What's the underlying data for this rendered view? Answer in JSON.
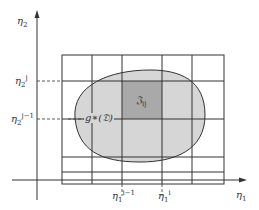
{
  "diagram": {
    "axes": {
      "x_label": "η",
      "x_label_sub": "1",
      "y_label": "η",
      "y_label_sub": "2"
    },
    "ticks": {
      "x_left": {
        "base": "η",
        "sub": "1",
        "sup": "i−1"
      },
      "x_right": {
        "base": "η",
        "sub": "1",
        "sup": "i"
      },
      "y_top": {
        "base": "η",
        "sub": "2",
        "sup": "j"
      },
      "y_bottom": {
        "base": "η",
        "sub": "2",
        "sup": "j−1"
      }
    },
    "region_label": "g∗(𝔇)",
    "cell_label": "𝔍",
    "cell_label_sub": "ij",
    "colors": {
      "region_fill": "#d6d6d6",
      "cell_fill": "#a9a9a9",
      "lines": "#333333"
    }
  }
}
